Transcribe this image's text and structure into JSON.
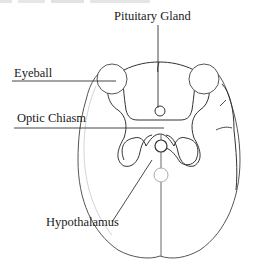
{
  "diagram": {
    "type": "anatomical-line-drawing",
    "stroke_color": "#333333",
    "faint_stroke_color": "#bfbfbf",
    "background": "#ffffff",
    "labels": {
      "pituitary_gland": "Pituitary Gland",
      "eyeball": "Eyeball",
      "optic_chiasm": "Optic Chiasm",
      "hypothalamus": "Hypothalamus"
    }
  }
}
